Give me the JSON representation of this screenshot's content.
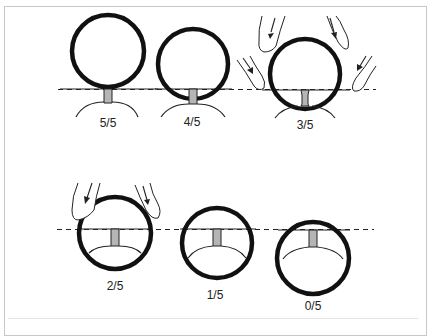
{
  "figure": {
    "stages": [
      {
        "label": "5/5",
        "fingers": 0
      },
      {
        "label": "4/5",
        "fingers": 0
      },
      {
        "label": "3/5",
        "fingers": 4
      },
      {
        "label": "2/5",
        "fingers": 2
      },
      {
        "label": "1/5",
        "fingers": 0
      },
      {
        "label": "0/5",
        "fingers": 0
      }
    ]
  },
  "colors": {
    "ring": "#111111",
    "neck_fill": "#b5b5b5",
    "frame": "#c8c8c8"
  }
}
